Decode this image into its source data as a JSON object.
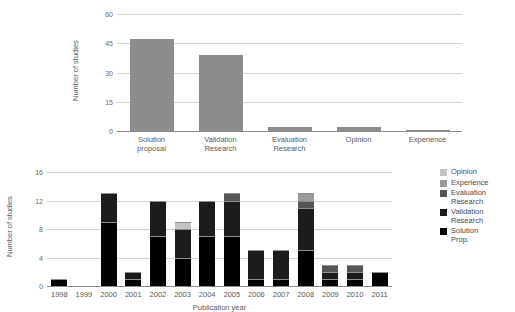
{
  "chart_data": [
    {
      "type": "bar",
      "id": "research-type-totals",
      "title": "",
      "xlabel": "",
      "ylabel": "Number of studies",
      "categories": [
        "Solution\nproposal",
        "Validation\nResearch",
        "Evaluation\nResearch",
        "Opinion",
        "Experience"
      ],
      "values": [
        47,
        39,
        2,
        2,
        0.3
      ],
      "ylim": [
        0,
        60
      ],
      "yticks": [
        "0",
        "15",
        "30",
        "45",
        "60"
      ],
      "ytick_values": [
        0,
        15,
        30,
        45,
        60
      ],
      "grid": true,
      "legend": "none",
      "bar_color": "#8c8c8c"
    },
    {
      "type": "bar",
      "id": "studies-per-year-stacked",
      "stacked": true,
      "title": "",
      "xlabel": "Publication year",
      "ylabel": "Number of studies",
      "categories": [
        "1998",
        "1999",
        "2000",
        "2001",
        "2002",
        "2003",
        "2004",
        "2005",
        "2006",
        "2007",
        "2008",
        "2009",
        "2010",
        "2011"
      ],
      "ylim": [
        0,
        16
      ],
      "yticks": [
        "0",
        "4",
        "8",
        "12",
        "16"
      ],
      "ytick_values": [
        0,
        4,
        8,
        12,
        16
      ],
      "grid": true,
      "legend": "right",
      "series": [
        {
          "name": "Solution Prop.",
          "color": "#000000",
          "values": [
            1,
            0,
            9,
            1,
            7,
            4,
            7,
            7,
            1,
            1,
            5,
            1,
            1,
            2
          ]
        },
        {
          "name": "Validation Research",
          "color": "#1c1c1c",
          "values": [
            0,
            0,
            4,
            1,
            5,
            4,
            5,
            5,
            4,
            4,
            6,
            1,
            1,
            0
          ]
        },
        {
          "name": "Evaluation Research",
          "color": "#555555",
          "values": [
            0,
            0,
            0,
            0,
            0,
            0,
            0,
            1,
            0,
            0,
            1,
            1,
            1,
            0
          ]
        },
        {
          "name": "Experience",
          "color": "#9a9a9a",
          "values": [
            0,
            0,
            0,
            0,
            0,
            0,
            0,
            0,
            0,
            0,
            1,
            0,
            0,
            0
          ]
        },
        {
          "name": "Opinion",
          "color": "#c4c4c4",
          "values": [
            0,
            0,
            0,
            0,
            0,
            1,
            0,
            0,
            0,
            0,
            0,
            0,
            0,
            0
          ]
        }
      ],
      "totals": [
        1,
        0,
        13,
        2,
        12,
        9,
        12,
        13,
        5,
        5,
        13,
        3,
        3,
        2
      ]
    }
  ],
  "legend": {
    "entries": [
      {
        "label": "Opinion",
        "color": "#c4c4c4"
      },
      {
        "label": "Experience",
        "color": "#9a9a9a"
      },
      {
        "label": "Evaluation\nResearch",
        "color": "#555555"
      },
      {
        "label": "Validation\nResearch",
        "color": "#1c1c1c"
      },
      {
        "label": "Solution\nProp.",
        "color": "#000000"
      }
    ]
  }
}
